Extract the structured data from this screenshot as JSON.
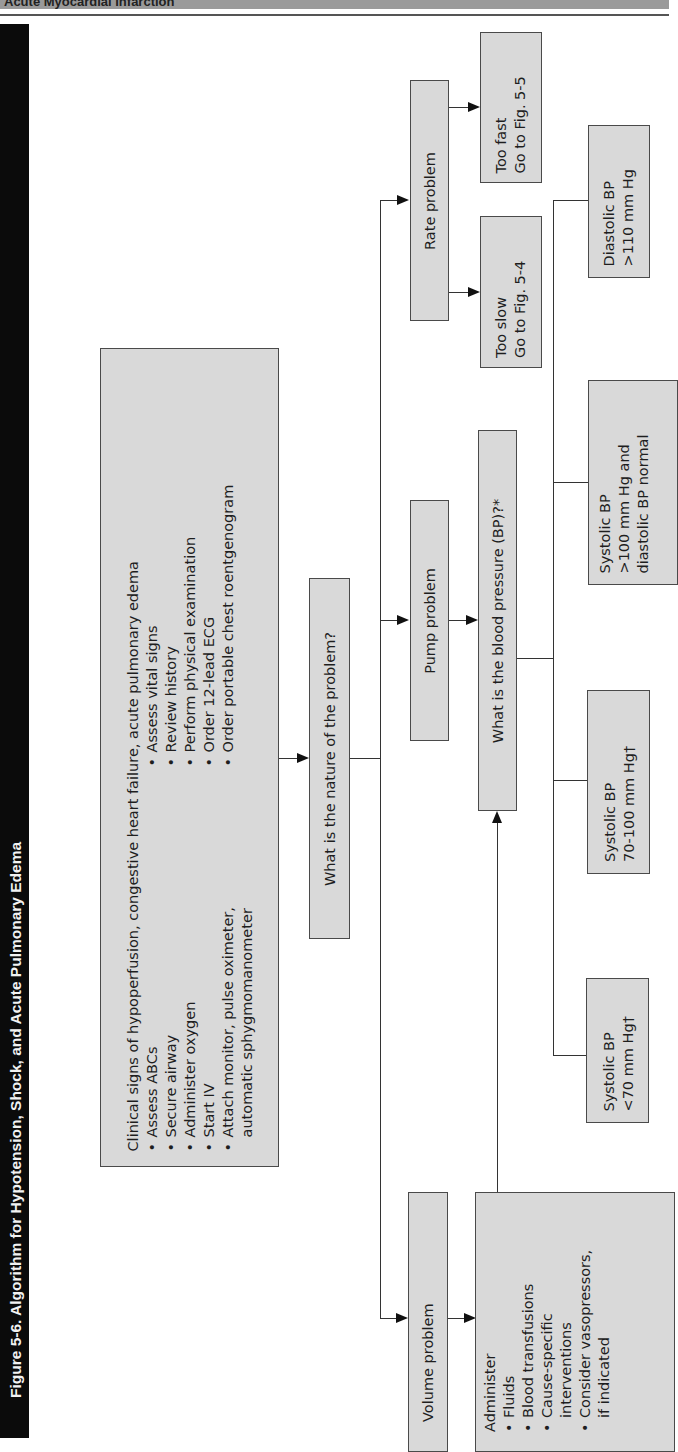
{
  "header": {
    "running_title": "Acute Myocardial Infarction",
    "figure_title": "Figure 5-6.  Algorithm for Hypotension, Shock, and Acute Pulmonary Edema"
  },
  "flowchart": {
    "start": {
      "heading": "Clinical signs of hypoperfusion, congestive heart failure, acute pulmonary edema",
      "col1": [
        "Assess ABCs",
        "Secure airway",
        "Administer oxygen",
        "Start IV",
        "Attach monitor, pulse oximeter,",
        "automatic sphygmomanometer"
      ],
      "col2": [
        "Assess vital signs",
        "Review history",
        "Perform physical examination",
        "Order 12-lead ECG",
        "Order portable chest roentgenogram"
      ]
    },
    "nature_question": "What is the nature of the problem?",
    "volume": {
      "label": "Volume problem",
      "actions_heading": "Administer",
      "actions": [
        "Fluids",
        "Blood transfusions",
        "Cause-specific",
        "interventions",
        "Consider vasopressors,",
        "if indicated"
      ]
    },
    "pump": {
      "label": "Pump problem"
    },
    "bp_question": "What is the blood pressure (BP)?*",
    "bp_branches": [
      {
        "line1": "Systolic BP",
        "line2": "<70 mm Hg†"
      },
      {
        "line1": "Systolic BP",
        "line2": "70-100 mm Hg†"
      },
      {
        "line1": "Systolic BP",
        "line2": ">100 mm Hg and",
        "line3": "diastolic BP normal"
      },
      {
        "line1": "Diastolic BP",
        "line2": ">110 mm Hg"
      }
    ],
    "rate": {
      "label": "Rate problem",
      "too_slow": {
        "line1": "Too slow",
        "line2": "Go to Fig. 5-4"
      },
      "too_fast": {
        "line1": "Too fast",
        "line2": "Go to Fig. 5-5"
      }
    }
  },
  "bullet": "•"
}
